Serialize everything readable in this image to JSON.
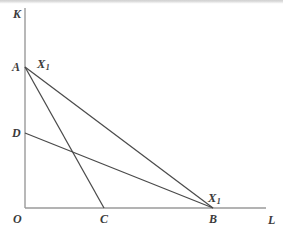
{
  "figure": {
    "type": "economics-isoquant-isocost-diagram",
    "background_color": "#ffffff",
    "axis_color": "#9a9a9a",
    "line_color": "#4a4a4a",
    "label_color": "#3b3b3b"
  },
  "axes": {
    "vertical": {
      "label": "K",
      "name": "capital-axis",
      "x": 25,
      "y_top": 8,
      "y_bottom": 208
    },
    "horizontal": {
      "label": "L",
      "name": "labour-axis",
      "y": 208,
      "x_left": 25,
      "x_right": 266
    },
    "origin": {
      "label": "O",
      "x": 25,
      "y": 208
    }
  },
  "points": [
    {
      "label": "A",
      "x": 25,
      "y": 67,
      "on_axis": "K"
    },
    {
      "label": "D",
      "x": 25,
      "y": 133,
      "on_axis": "K"
    },
    {
      "label": "C",
      "x": 104,
      "y": 208,
      "on_axis": "L"
    },
    {
      "label": "B",
      "x": 213,
      "y": 208,
      "on_axis": "L"
    }
  ],
  "lines": [
    {
      "name": "line-A-B",
      "from": "A",
      "to": "B",
      "x1": 25,
      "y1": 67,
      "x2": 213,
      "y2": 208
    },
    {
      "name": "line-A-C",
      "from": "A",
      "to": "C",
      "x1": 25,
      "y1": 67,
      "x2": 104,
      "y2": 208
    },
    {
      "name": "line-D-B",
      "from": "D",
      "to": "B",
      "x1": 25,
      "y1": 133,
      "x2": 213,
      "y2": 208
    }
  ],
  "curve_labels": [
    {
      "name": "isoquant-label-top",
      "text": "X",
      "subscript": "1",
      "x": 37,
      "y": 58,
      "anchors": "A"
    },
    {
      "name": "isoquant-label-bottom",
      "text": "X",
      "subscript": "1",
      "x": 208,
      "y": 192,
      "anchors": "B"
    }
  ]
}
